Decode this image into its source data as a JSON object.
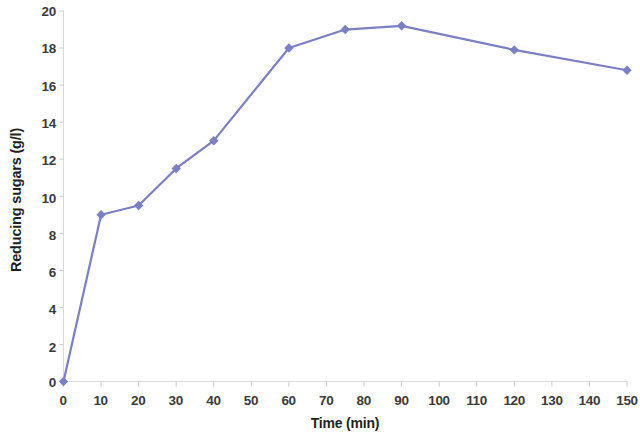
{
  "chart_data": {
    "type": "line",
    "title": "",
    "xlabel": "Time (min)",
    "ylabel": "Reducing sugars (g/l)",
    "xlim": [
      0,
      150
    ],
    "ylim": [
      0,
      20
    ],
    "xticks": [
      0,
      10,
      20,
      30,
      40,
      50,
      60,
      70,
      80,
      90,
      100,
      110,
      120,
      130,
      140,
      150
    ],
    "yticks": [
      0,
      2,
      4,
      6,
      8,
      10,
      12,
      14,
      16,
      18,
      20
    ],
    "xtick_labels": [
      "0",
      "10",
      "20",
      "30",
      "40",
      "50",
      "60",
      "70",
      "80",
      "90",
      "100",
      "110",
      "120",
      "130",
      "140",
      "150"
    ],
    "ytick_labels": [
      "0",
      "2",
      "4",
      "6",
      "8",
      "10",
      "12",
      "14",
      "16",
      "18",
      "20"
    ],
    "grid": false,
    "legend": false,
    "legend_position": "none",
    "marker": "diamond",
    "series": [
      {
        "name": "Reducing sugars",
        "color": "#7b7fc4",
        "x": [
          0,
          10,
          20,
          30,
          40,
          60,
          75,
          90,
          120,
          150
        ],
        "values": [
          0.0,
          9.0,
          9.5,
          11.5,
          13.0,
          18.0,
          19.0,
          19.2,
          17.9,
          16.8
        ],
        "points": [
          {
            "x": 0,
            "y": 0.0
          },
          {
            "x": 10,
            "y": 9.0
          },
          {
            "x": 20,
            "y": 9.5
          },
          {
            "x": 30,
            "y": 11.5
          },
          {
            "x": 40,
            "y": 13.0
          },
          {
            "x": 60,
            "y": 18.0
          },
          {
            "x": 75,
            "y": 19.0
          },
          {
            "x": 90,
            "y": 19.2
          },
          {
            "x": 120,
            "y": 17.9
          },
          {
            "x": 150,
            "y": 16.8
          }
        ]
      }
    ]
  },
  "style": {
    "line_color": "#7b7fc4",
    "marker_color": "#7b7fc4",
    "axis_color": "#d9d9d9",
    "tick_color": "#bfbfbf",
    "label_color": "#3b3b3b",
    "title_color": "#231f20",
    "background": "#ffffff",
    "line_width": 2.2,
    "marker_size": 7
  }
}
